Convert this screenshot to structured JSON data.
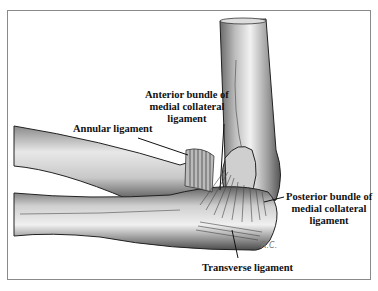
{
  "figure": {
    "labels": {
      "anterior_bundle": [
        "Anterior bundle of",
        "medial collateral",
        "ligament"
      ],
      "annular": "Annular ligament",
      "posterior_bundle": [
        "Posterior bundle of",
        "medial collateral",
        "ligament"
      ],
      "transverse": "Transverse ligament"
    },
    "signature": "R.C."
  }
}
